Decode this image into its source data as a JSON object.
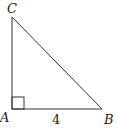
{
  "diagram": {
    "type": "right-triangle",
    "vertices": {
      "A": {
        "label": "A"
      },
      "B": {
        "label": "B"
      },
      "C": {
        "label": "C"
      }
    },
    "right_angle_at": "A",
    "side_labels": {
      "AB": "4"
    },
    "colors": {
      "stroke": "#333333",
      "text": "#222222",
      "background": "#ffffff"
    }
  }
}
